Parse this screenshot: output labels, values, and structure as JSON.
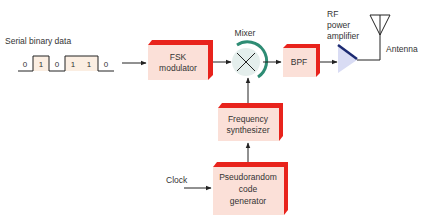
{
  "colors": {
    "box_fill": "#fbe0d8",
    "box_edge": "#e8231c",
    "mixer_fill": "#e4eeec",
    "mixer_arc": "#2e8c74",
    "amp_fill": "#d9dcf4",
    "amp_edge": "#1c2a72",
    "line": "#222222",
    "bit_high_fill": "#fbeee2"
  },
  "input": {
    "label": "Serial binary data",
    "bits": [
      "0",
      "1",
      "0",
      "1",
      "1",
      "0"
    ]
  },
  "blocks": {
    "fsk_modulator": {
      "line1": "FSK",
      "line2": "modulator"
    },
    "mixer": {
      "label": "Mixer"
    },
    "bpf": {
      "label": "BPF"
    },
    "rf_amplifier": {
      "line1": "RF",
      "line2": "power",
      "line3": "amplifier"
    },
    "antenna": {
      "label": "Antenna"
    },
    "frequency_synthesizer": {
      "line1": "Frequency",
      "line2": "synthesizer"
    },
    "pseudorandom_generator": {
      "line1": "Pseudorandom",
      "line2": "code",
      "line3": "generator"
    },
    "clock": {
      "label": "Clock"
    }
  }
}
